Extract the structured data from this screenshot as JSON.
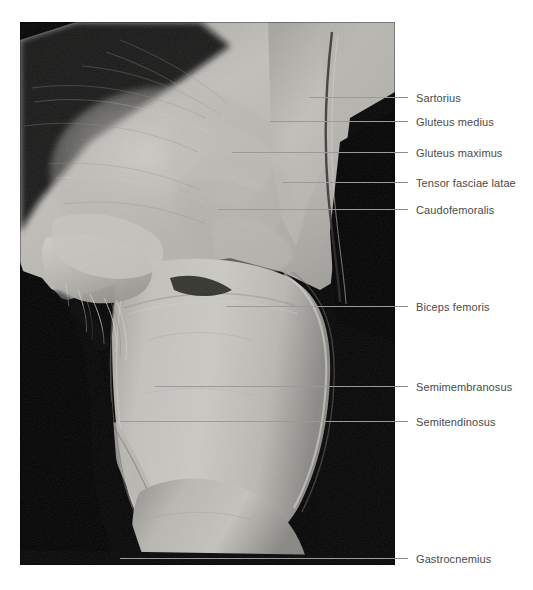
{
  "figure": {
    "photo": {
      "left": 20,
      "top": 22,
      "width": 375,
      "height": 543,
      "background_color": "#000000",
      "tissue_color_light": "#c9c7c2",
      "tissue_color_mid": "#a9a7a2",
      "tissue_color_dark": "#7d7b77"
    },
    "label_color": "#4a4a4a",
    "leader_color": "#8d8d8d"
  },
  "labels": [
    {
      "id": "sartorius",
      "text": "Sartorius",
      "line_y": 97,
      "line_start_x": 309,
      "line_end_x": 408,
      "text_x": 416,
      "text_y": 92
    },
    {
      "id": "gluteus-medius",
      "text": "Gluteus medius",
      "line_y": 121,
      "line_start_x": 270,
      "line_end_x": 408,
      "text_x": 416,
      "text_y": 116
    },
    {
      "id": "gluteus-maximus",
      "text": "Gluteus maximus",
      "line_y": 152,
      "line_start_x": 232,
      "line_end_x": 408,
      "text_x": 416,
      "text_y": 147
    },
    {
      "id": "tensor-fasciae-latae",
      "text": "Tensor fasciae latae",
      "line_y": 182,
      "line_start_x": 283,
      "line_end_x": 408,
      "text_x": 416,
      "text_y": 177
    },
    {
      "id": "caudofemoralis",
      "text": "Caudofemoralis",
      "line_y": 209,
      "line_start_x": 218,
      "line_end_x": 408,
      "text_x": 416,
      "text_y": 204
    },
    {
      "id": "biceps-femoris",
      "text": "Biceps femoris",
      "line_y": 306,
      "line_start_x": 226,
      "line_end_x": 408,
      "text_x": 416,
      "text_y": 301
    },
    {
      "id": "semimembranosus",
      "text": "Semimembranosus",
      "line_y": 386,
      "line_start_x": 155,
      "line_end_x": 408,
      "text_x": 416,
      "text_y": 381
    },
    {
      "id": "semitendinosus",
      "text": "Semitendinosus",
      "line_y": 421,
      "line_start_x": 120,
      "line_end_x": 408,
      "text_x": 416,
      "text_y": 416
    },
    {
      "id": "gastrocnemius",
      "text": "Gastrocnemius",
      "line_y": 558,
      "line_start_x": 120,
      "line_end_x": 408,
      "text_x": 416,
      "text_y": 553
    }
  ]
}
